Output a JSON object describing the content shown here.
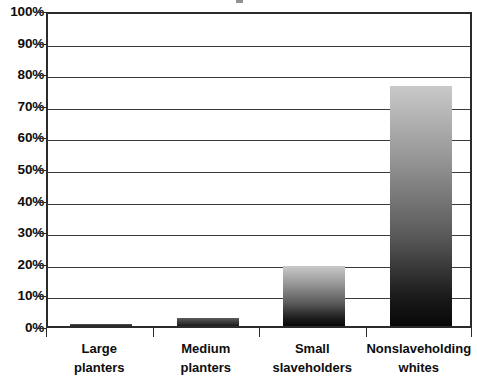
{
  "chart_data": {
    "type": "bar",
    "title": "",
    "xlabel": "",
    "ylabel": "",
    "categories": [
      "Large planters",
      "Medium planters",
      "Small slaveholders",
      "Nonslaveholding whites"
    ],
    "category_lines": [
      [
        "Large",
        "planters"
      ],
      [
        "Medium",
        "planters"
      ],
      [
        "Small",
        "slaveholders"
      ],
      [
        "Nonslaveholding",
        "whites"
      ]
    ],
    "values": [
      0.5,
      2.5,
      19,
      76
    ],
    "ylim": [
      0,
      100
    ],
    "ytick_values": [
      0,
      10,
      20,
      30,
      40,
      50,
      60,
      70,
      80,
      90,
      100
    ],
    "ytick_labels": [
      "0%",
      "10%",
      "20%",
      "30%",
      "40%",
      "50%",
      "60%",
      "70%",
      "80%",
      "90%",
      "100%"
    ],
    "grid": true,
    "legend": "none",
    "bar_fill": "vertical gradient light-gray to black",
    "bar_color_top": "#c9c9c9",
    "bar_color_bottom": "#080808",
    "axis_color": "#2b2b2b",
    "gridline_color": "#3a3a3a",
    "background": "#ffffff"
  }
}
